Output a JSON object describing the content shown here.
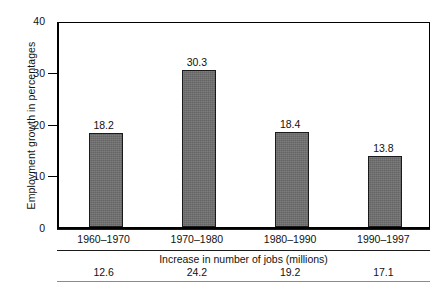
{
  "chart_data": {
    "type": "bar",
    "title": "",
    "xlabel": "",
    "ylabel": "Employment growth in percentages",
    "categories": [
      "1960–1970",
      "1970–1980",
      "1980–1990",
      "1990–1997"
    ],
    "values": [
      18.2,
      30.3,
      18.4,
      13.8
    ],
    "value_labels": [
      "18.2",
      "30.3",
      "18.4",
      "13.8"
    ],
    "ylim": [
      0,
      40
    ],
    "yticks": [
      0,
      10,
      20,
      30,
      40
    ],
    "ytick_labels": [
      "0",
      "10",
      "20",
      "30",
      "40"
    ],
    "grid": false,
    "legend": "none",
    "bar_color": "#6f6f6f",
    "bar_border_color": "#1a1a1a",
    "axis_color": "#000000",
    "background": "#ffffff",
    "secondary_table": {
      "caption": "Increase in number of jobs (millions)",
      "categories": [
        "1960–1970",
        "1970–1980",
        "1980–1990",
        "1990–1997"
      ],
      "values": [
        12.6,
        24.2,
        19.2,
        17.1
      ],
      "value_labels": [
        "12.6",
        "24.2",
        "19.2",
        "17.1"
      ]
    }
  }
}
